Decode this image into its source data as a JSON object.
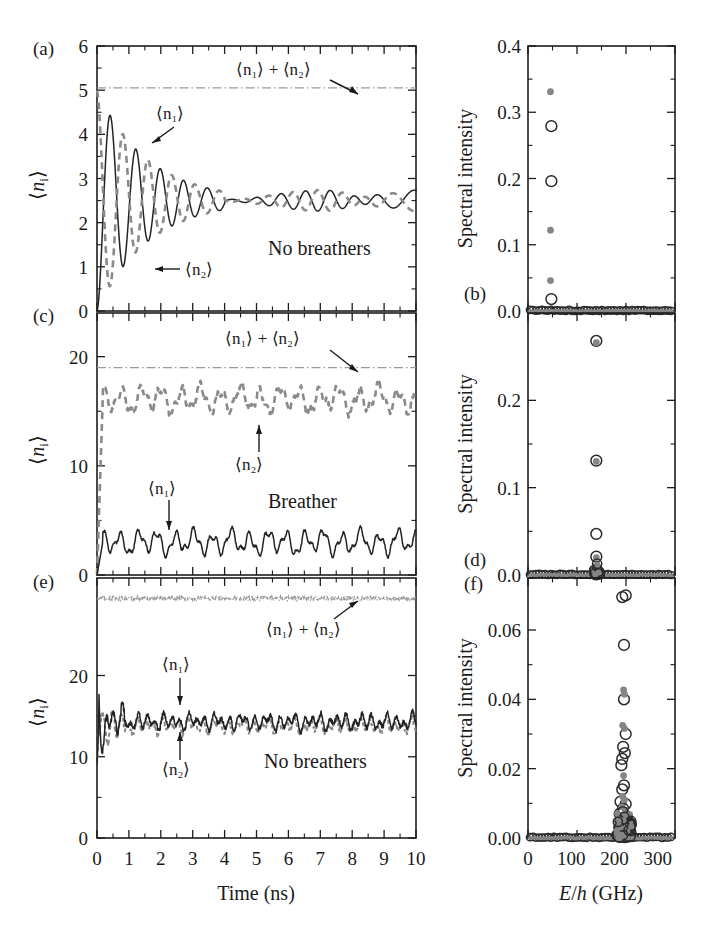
{
  "figure": {
    "panels": [
      "(a)",
      "(b)",
      "(c)",
      "(d)",
      "(e)",
      "(f)"
    ],
    "axis_labels": {
      "time": "Time (ns)",
      "energy_pre": "E",
      "energy_slash": "/",
      "energy_h": "h",
      "energy_unit": " (GHz)",
      "n_i": "⟨nᵢ⟩",
      "spectral": "Spectral intensity"
    },
    "annotations": {
      "sum": "⟨n₁⟩ + ⟨n₂⟩",
      "n1": "⟨n₁⟩",
      "n2": "⟨n₂⟩",
      "no_breathers": "No breathers",
      "breather": "Breather"
    },
    "colors": {
      "solid_curve": "#232323",
      "dashed_curve": "#8a8a8a",
      "dashdot_curve": "#9a9a9a",
      "marker_open": "#2a2a2a",
      "marker_filled": "#858585",
      "axis": "#1d1d1d"
    }
  },
  "chart_data": [
    {
      "id": "a",
      "type": "line",
      "panel_label": "(a)",
      "xlabel": "Time (ns)",
      "ylabel": "⟨nᵢ⟩",
      "xlim": [
        0,
        10
      ],
      "ylim": [
        0,
        6
      ],
      "xticks": [
        0,
        1,
        2,
        3,
        4,
        5,
        6,
        7,
        8,
        9,
        10
      ],
      "yticks": [
        0,
        1,
        2,
        3,
        4,
        5,
        6
      ],
      "ytick_labels": [
        "0",
        "1",
        "2",
        "3",
        "4",
        "5",
        "6"
      ],
      "grid": false,
      "note": "No breathers",
      "series": [
        {
          "name": "⟨n₁⟩",
          "style": "solid"
        },
        {
          "name": "⟨n₂⟩",
          "style": "dashed"
        },
        {
          "name": "⟨n₁⟩ + ⟨n₂⟩",
          "style": "dash-dot",
          "constant": 5.05
        }
      ],
      "equilibrium": 2.5,
      "initial_amplitude": 2.5,
      "damping_time_ns": 1.6,
      "oscillation_period_ns": 0.85
    },
    {
      "id": "b",
      "type": "scatter",
      "panel_label": "(b)",
      "xlabel": "E/h (GHz)",
      "ylabel": "Spectral intensity",
      "xlim": [
        0,
        340
      ],
      "ylim": [
        0.0,
        0.4
      ],
      "xticks": [
        0,
        100,
        200,
        300
      ],
      "yticks": [
        0.0,
        0.1,
        0.2,
        0.3,
        0.4
      ],
      "ytick_labels": [
        "0.0",
        "0.1",
        "0.2",
        "0.3",
        "0.4"
      ],
      "grid": false,
      "series": [
        {
          "name": "filled",
          "marker": "filled-circle",
          "points": [
            [
              52,
              0.331
            ],
            [
              52,
              0.122
            ],
            [
              52,
              0.046
            ]
          ]
        },
        {
          "name": "open",
          "marker": "open-circle",
          "points": [
            [
              54,
              0.279
            ],
            [
              54,
              0.196
            ],
            [
              54,
              0.018
            ]
          ]
        }
      ],
      "baseline_note": "dense band of markers along y = 0 across full x range"
    },
    {
      "id": "c",
      "type": "line",
      "panel_label": "(c)",
      "xlabel": "Time (ns)",
      "ylabel": "⟨nᵢ⟩",
      "xlim": [
        0,
        10
      ],
      "ylim": [
        0,
        24
      ],
      "xticks": [
        0,
        1,
        2,
        3,
        4,
        5,
        6,
        7,
        8,
        9,
        10
      ],
      "yticks": [
        0,
        10,
        20
      ],
      "ytick_labels": [
        "0",
        "10",
        "20"
      ],
      "grid": false,
      "note": "Breather",
      "series": [
        {
          "name": "⟨n₁⟩",
          "style": "solid",
          "mean": 3.0,
          "ripple": 1.0
        },
        {
          "name": "⟨n₂⟩",
          "style": "dashed",
          "mean": 16.0,
          "ripple": 1.1
        },
        {
          "name": "⟨n₁⟩ + ⟨n₂⟩",
          "style": "dash-dot",
          "constant": 19.0
        }
      ]
    },
    {
      "id": "d",
      "type": "scatter",
      "panel_label": "(d)",
      "xlabel": "E/h (GHz)",
      "ylabel": "Spectral intensity",
      "xlim": [
        0,
        340
      ],
      "ylim": [
        0.0,
        0.3
      ],
      "yticks": [
        0.0,
        0.1,
        0.2
      ],
      "ytick_labels": [
        "0.0",
        "0.1",
        "0.2"
      ],
      "xticks": [
        0,
        100,
        200,
        300
      ],
      "grid": false,
      "series": [
        {
          "name": "open",
          "marker": "open-circle",
          "points": [
            [
              158,
              0.268
            ],
            [
              158,
              0.131
            ],
            [
              158,
              0.047
            ],
            [
              158,
              0.021
            ]
          ]
        },
        {
          "name": "filled",
          "marker": "filled-circle",
          "points": [
            [
              158,
              0.266
            ],
            [
              158,
              0.13
            ],
            [
              158,
              0.02
            ],
            [
              158,
              0.01
            ]
          ]
        }
      ],
      "baseline_note": "dense band of markers along y = 0 across full x range"
    },
    {
      "id": "e",
      "type": "line",
      "panel_label": "(e)",
      "xlabel": "Time (ns)",
      "ylabel": "⟨nᵢ⟩",
      "xlim": [
        0,
        10
      ],
      "ylim": [
        0,
        32
      ],
      "xticks": [
        0,
        1,
        2,
        3,
        4,
        5,
        6,
        7,
        8,
        9,
        10
      ],
      "yticks": [
        0,
        10,
        20
      ],
      "ytick_labels": [
        "0",
        "10",
        "20"
      ],
      "grid": false,
      "note": "No breathers",
      "series": [
        {
          "name": "⟨n₁⟩",
          "style": "solid",
          "mean": 14.2
        },
        {
          "name": "⟨n₂⟩",
          "style": "dashed",
          "mean": 13.8
        },
        {
          "name": "⟨n₁⟩ + ⟨n₂⟩",
          "style": "dash-dot-noisy",
          "constant": 29.5
        }
      ]
    },
    {
      "id": "f",
      "type": "scatter",
      "panel_label": "(f)",
      "xlabel": "E/h (GHz)",
      "ylabel": "Spectral intensity",
      "xlim": [
        0,
        340
      ],
      "ylim": [
        0.0,
        0.075
      ],
      "xticks": [
        0,
        100,
        200,
        300
      ],
      "yticks": [
        0.0,
        0.02,
        0.04,
        0.06
      ],
      "ytick_labels": [
        "0.00",
        "0.02",
        "0.04",
        "0.06"
      ],
      "grid": false,
      "series": [
        {
          "name": "open",
          "marker": "open-circle",
          "points": [
            [
              218,
              0.0695
            ],
            [
              226,
              0.07
            ],
            [
              222,
              0.0557
            ],
            [
              222,
              0.04
            ],
            [
              226,
              0.03
            ],
            [
              220,
              0.0263
            ],
            [
              224,
              0.0245
            ],
            [
              218,
              0.0228
            ],
            [
              216,
              0.021
            ],
            [
              222,
              0.0152
            ],
            [
              218,
              0.014
            ],
            [
              214,
              0.0105
            ],
            [
              226,
              0.0098
            ],
            [
              220,
              0.0085
            ],
            [
              212,
              0.007
            ],
            [
              228,
              0.0062
            ],
            [
              224,
              0.005
            ],
            [
              216,
              0.0042
            ],
            [
              220,
              0.003
            ]
          ]
        },
        {
          "name": "filled",
          "marker": "filled-circle",
          "points": [
            [
              221,
              0.0427
            ],
            [
              223,
              0.0415
            ],
            [
              219,
              0.0325
            ],
            [
              223,
              0.0316
            ],
            [
              221,
              0.018
            ],
            [
              219,
              0.012
            ],
            [
              223,
              0.011
            ],
            [
              217,
              0.009
            ],
            [
              225,
              0.008
            ],
            [
              221,
              0.0065
            ],
            [
              219,
              0.0048
            ],
            [
              223,
              0.004
            ],
            [
              221,
              0.0028
            ],
            [
              217,
              0.0022
            ],
            [
              225,
              0.0018
            ]
          ]
        }
      ],
      "baseline_note": "dense band of markers along y = 0 across full x range"
    }
  ],
  "tick_labels": {
    "time": [
      "0",
      "1",
      "2",
      "3",
      "4",
      "5",
      "6",
      "7",
      "8",
      "9",
      "10"
    ],
    "energy": [
      "0",
      "100",
      "200",
      "300"
    ]
  }
}
